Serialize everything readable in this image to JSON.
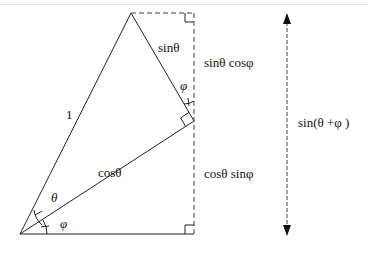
{
  "diagram": {
    "labels": {
      "hypotenuse": "1",
      "opposite_top": "sinθ",
      "adjacent_mid": "cosθ",
      "segment_top": "sinθ cosφ",
      "segment_bottom": "cosθ sinφ",
      "total_height": "sin(θ +φ )",
      "angle_theta": "θ",
      "angle_phi_bottom": "φ",
      "angle_phi_top": "φ"
    },
    "points": {
      "origin": [
        20,
        234
      ],
      "apex": [
        131,
        13
      ],
      "right_angle_vertex": [
        194,
        121
      ],
      "top_right": [
        194,
        13
      ],
      "bottom_right": [
        194,
        234
      ]
    },
    "arrow": {
      "x": 287,
      "y_top": 13,
      "y_bottom": 236
    },
    "colors": {
      "line": "#222222",
      "dashed": "#444444"
    }
  }
}
